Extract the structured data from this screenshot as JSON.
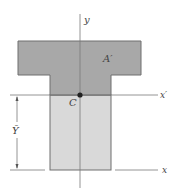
{
  "diagram": {
    "labels": {
      "y_axis": "y",
      "x_axis": "x",
      "x_prime_axis": "x′",
      "area": "A′",
      "centroid": "C",
      "dimension": "Ȳ"
    },
    "colors": {
      "upper_area": "#a8a8a8",
      "lower_area": "#d9d9d9",
      "outline": "#6e6e6e",
      "axis": "#7a7a7a",
      "centroid_dot": "#222222"
    }
  }
}
